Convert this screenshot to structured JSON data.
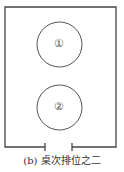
{
  "diagram": {
    "tables": [
      {
        "label": "①"
      },
      {
        "label": "②"
      }
    ],
    "caption": "(b) 桌次排位之二",
    "colors": {
      "stroke": "#444444",
      "background": "#ffffff"
    }
  }
}
